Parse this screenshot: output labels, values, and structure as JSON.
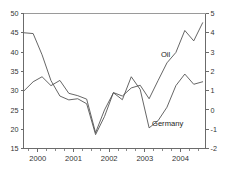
{
  "chart_data": {
    "type": "line",
    "title": "",
    "subtitle": "",
    "xlabel": "",
    "ylabel": "",
    "grid": false,
    "legend_position": "inline-annotations",
    "x_axis": {
      "tick_labels": [
        "2000",
        "2001",
        "2002",
        "2003",
        "2004"
      ],
      "tick_values": [
        2000,
        2001,
        2002,
        2003,
        2004
      ],
      "minor_ticks_per_year": 4,
      "range": [
        1999.6,
        2004.7
      ]
    },
    "left_axis": {
      "label": "",
      "tick_labels": [
        "15",
        "20",
        "25",
        "30",
        "35",
        "40",
        "45",
        "50"
      ],
      "tick_values": [
        15,
        20,
        25,
        30,
        35,
        40,
        45,
        50
      ],
      "ylim": [
        15,
        50
      ],
      "series": "Oil"
    },
    "right_axis": {
      "label": "",
      "tick_labels": [
        "-2",
        "-1",
        "0",
        "1",
        "2",
        "3",
        "4",
        "5"
      ],
      "tick_values": [
        -2,
        -1,
        0,
        1,
        2,
        3,
        4,
        5
      ],
      "ylim": [
        -2,
        5
      ],
      "series": "Germany"
    },
    "series": [
      {
        "name": "Oil",
        "axis": "left",
        "color": "#4a4a4a",
        "annotation": {
          "text": "Oil",
          "x": 2003.45,
          "y": 38.6
        },
        "x": [
          1999.62,
          1999.87,
          2000.12,
          2000.37,
          2000.62,
          2000.87,
          2001.12,
          2001.37,
          2001.62,
          2001.87,
          2002.12,
          2002.37,
          2002.62,
          2002.87,
          2003.12,
          2003.37,
          2003.62,
          2003.87,
          2004.12,
          2004.37,
          2004.62
        ],
        "values": [
          45.0,
          44.8,
          39.3,
          32.6,
          28.6,
          27.6,
          27.9,
          26.6,
          18.6,
          23.3,
          29.5,
          28.6,
          30.7,
          31.4,
          27.9,
          32.6,
          37.2,
          39.9,
          45.6,
          42.9,
          47.6
        ]
      },
      {
        "name": "Germany",
        "axis": "right",
        "color": "#4a4a4a",
        "annotation": {
          "text": "Germany",
          "x": 2003.2,
          "y": -0.85
        },
        "x": [
          1999.62,
          1999.87,
          2000.12,
          2000.37,
          2000.62,
          2000.87,
          2001.12,
          2001.37,
          2001.62,
          2001.87,
          2002.12,
          2002.37,
          2002.62,
          2002.87,
          2003.12,
          2003.37,
          2003.62,
          2003.87,
          2004.12,
          2004.37,
          2004.62
        ],
        "values": [
          1.0,
          1.46,
          1.72,
          1.26,
          1.53,
          0.86,
          0.74,
          0.56,
          -1.18,
          0.0,
          0.89,
          0.53,
          1.72,
          1.06,
          -0.93,
          -0.56,
          0.14,
          1.26,
          1.86,
          1.33,
          1.46
        ]
      }
    ]
  }
}
